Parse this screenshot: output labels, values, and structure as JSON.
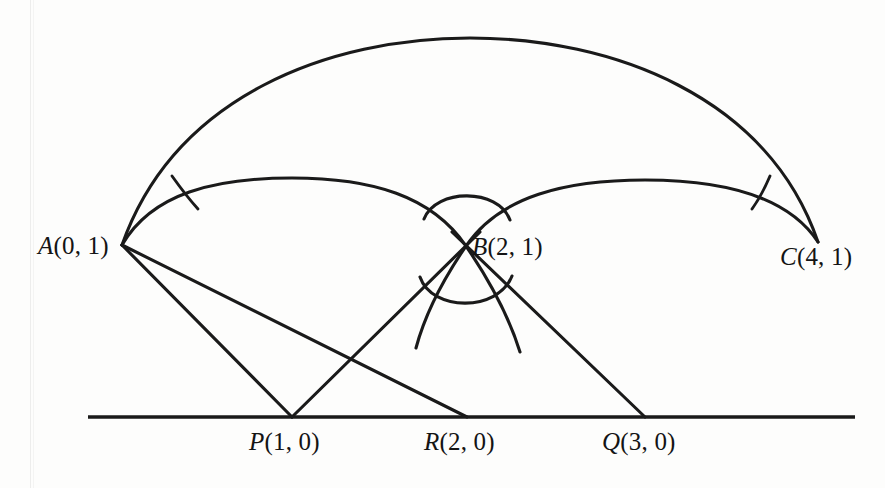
{
  "figure": {
    "type": "geometry-diagram",
    "background_color": "#fdfdfc",
    "ink_color": "#1a1a1a",
    "baseline": {
      "label": "",
      "y": 417,
      "x_start": 88,
      "x_end": 855
    },
    "points": [
      {
        "id": "A",
        "letter": "A",
        "coords": "(0, 1)",
        "label": "A(0, 1)",
        "x": 122,
        "y": 245,
        "label_x": 38,
        "label_y": 232
      },
      {
        "id": "B",
        "letter": "B",
        "coords": "(2, 1)",
        "label": "B(2, 1)",
        "x": 466,
        "y": 246,
        "label_x": 472,
        "label_y": 233
      },
      {
        "id": "C",
        "letter": "C",
        "coords": "(4, 1)",
        "label": "C(4, 1)",
        "x": 818,
        "y": 242,
        "label_x": 780,
        "label_y": 243
      },
      {
        "id": "P",
        "letter": "P",
        "coords": "(1, 0)",
        "label": "P(1, 0)",
        "x": 292,
        "y": 417,
        "label_x": 249,
        "label_y": 428
      },
      {
        "id": "R",
        "letter": "R",
        "coords": "(2, 0)",
        "label": "R(2, 0)",
        "x": 467,
        "y": 417,
        "label_x": 424,
        "label_y": 428
      },
      {
        "id": "Q",
        "letter": "Q",
        "coords": "(3, 0)",
        "label": "Q(3, 0)",
        "x": 645,
        "y": 417,
        "label_x": 602,
        "label_y": 428
      }
    ],
    "arcs": [
      {
        "id": "arc-A-C",
        "name": "outer-geodesic-A-to-C",
        "from": "A",
        "to": "C",
        "apex_x": 470,
        "apex_y": 38
      },
      {
        "id": "arc-A-B",
        "name": "geodesic-A-to-B",
        "from": "A",
        "to": "B",
        "apex_x": 292,
        "apex_y": 178
      },
      {
        "id": "arc-B-C",
        "name": "geodesic-B-to-C",
        "from": "B",
        "to": "C",
        "apex_x": 645,
        "apex_y": 180
      },
      {
        "id": "arc-lens-upper",
        "name": "small-lens-arc-upper",
        "apex_y": 185
      },
      {
        "id": "arc-lens-lower",
        "name": "small-lens-arc-lower",
        "apex_y": 312
      }
    ],
    "segments": [
      {
        "id": "seg-A-P",
        "name": "ray-A-to-P",
        "from": "A",
        "to": "P"
      },
      {
        "id": "seg-A-R",
        "name": "ray-A-to-R",
        "from": "A",
        "to": "R"
      },
      {
        "id": "seg-P-B",
        "name": "ray-P-through-B",
        "from": "P",
        "to": "B"
      },
      {
        "id": "seg-B-Q",
        "name": "ray-B-to-Q",
        "from": "B",
        "to": "Q"
      }
    ],
    "angle_marks": [
      {
        "id": "angle-at-A",
        "name": "angle-mark-at-A",
        "vertex": "A"
      },
      {
        "id": "angle-at-C",
        "name": "angle-mark-at-C",
        "vertex": "C"
      }
    ]
  }
}
